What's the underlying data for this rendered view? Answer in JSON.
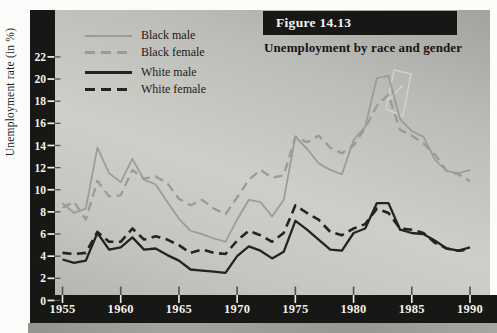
{
  "figure": {
    "label": "Figure 14.13",
    "subtitle": "Unemployment by race and gender"
  },
  "y_axis": {
    "title": "Unemployment rate (in %)",
    "ticks": [
      0,
      2,
      4,
      6,
      8,
      10,
      12,
      14,
      16,
      18,
      20,
      22
    ]
  },
  "x_axis": {
    "ticks": [
      1955,
      1960,
      1965,
      1970,
      1975,
      1980,
      1985,
      1990
    ]
  },
  "legend": {
    "items": [
      {
        "label": "Black male",
        "swatch": "solid-gray"
      },
      {
        "label": "Black female",
        "swatch": "dash-gray"
      },
      {
        "label": "White male",
        "swatch": "solid-dark"
      },
      {
        "label": "White female",
        "swatch": "dash-dark"
      }
    ]
  },
  "colors": {
    "black_series_line": "#9a9a96",
    "white_series_line": "#23231f",
    "axis_band": "#171715",
    "tick_label": "#f2f2ec",
    "plot_bg_top": "#a2a29e",
    "plot_bg_mid": "#cfcfca",
    "plot_bg_bottom": "#b5b5b1"
  },
  "chart_data": {
    "type": "line",
    "title": "Unemployment by race and gender",
    "figure_label": "Figure 14.13",
    "ylabel": "Unemployment rate (in %)",
    "xlabel": "",
    "xlim": [
      1955,
      1990
    ],
    "ylim": [
      0,
      23
    ],
    "grid": false,
    "legend_position": "top-left",
    "x": [
      1955,
      1956,
      1957,
      1958,
      1959,
      1960,
      1961,
      1962,
      1963,
      1964,
      1965,
      1966,
      1967,
      1968,
      1969,
      1970,
      1971,
      1972,
      1973,
      1974,
      1975,
      1976,
      1977,
      1978,
      1979,
      1980,
      1981,
      1982,
      1983,
      1984,
      1985,
      1986,
      1987,
      1988,
      1989,
      1990
    ],
    "series": [
      {
        "name": "Black male",
        "color": "#9a9a96",
        "line": "solid",
        "width": 1.7,
        "values": [
          8.8,
          7.9,
          8.3,
          13.8,
          11.5,
          10.7,
          12.8,
          10.9,
          10.5,
          8.9,
          7.4,
          6.3,
          6.0,
          5.6,
          5.3,
          7.3,
          9.1,
          8.9,
          7.6,
          9.1,
          14.8,
          13.7,
          12.4,
          11.8,
          11.4,
          14.5,
          15.7,
          20.1,
          20.3,
          16.4,
          15.3,
          14.8,
          12.7,
          11.7,
          11.5,
          11.8
        ]
      },
      {
        "name": "Black female",
        "color": "#9a9a96",
        "line": "dashed",
        "width": 2.3,
        "values": [
          8.4,
          8.9,
          7.3,
          10.8,
          9.4,
          9.5,
          11.8,
          11.0,
          11.2,
          10.6,
          9.2,
          8.6,
          9.1,
          8.3,
          7.8,
          9.3,
          10.9,
          11.8,
          11.1,
          11.3,
          14.8,
          14.3,
          14.9,
          13.8,
          13.3,
          14.0,
          15.6,
          17.6,
          18.6,
          15.4,
          14.9,
          14.2,
          13.2,
          11.7,
          11.4,
          10.8
        ]
      },
      {
        "name": "White male",
        "color": "#23231f",
        "line": "solid",
        "width": 2.3,
        "values": [
          3.7,
          3.4,
          3.6,
          6.1,
          4.6,
          4.8,
          5.7,
          4.6,
          4.7,
          4.1,
          3.6,
          2.8,
          2.7,
          2.6,
          2.5,
          4.0,
          4.9,
          4.5,
          3.8,
          4.4,
          7.2,
          6.4,
          5.5,
          4.6,
          4.5,
          6.1,
          6.5,
          8.8,
          8.8,
          6.4,
          6.1,
          6.0,
          5.4,
          4.7,
          4.5,
          4.8
        ]
      },
      {
        "name": "White female",
        "color": "#23231f",
        "line": "dashed",
        "width": 2.6,
        "values": [
          4.3,
          4.2,
          4.3,
          6.2,
          5.3,
          5.3,
          6.5,
          5.5,
          5.8,
          5.5,
          5.0,
          4.3,
          4.6,
          4.3,
          4.2,
          5.4,
          6.3,
          5.9,
          5.3,
          6.1,
          8.6,
          7.9,
          7.3,
          6.2,
          5.9,
          6.5,
          6.9,
          8.3,
          7.9,
          6.5,
          6.4,
          6.1,
          5.2,
          4.7,
          4.5,
          4.6
        ]
      }
    ]
  }
}
